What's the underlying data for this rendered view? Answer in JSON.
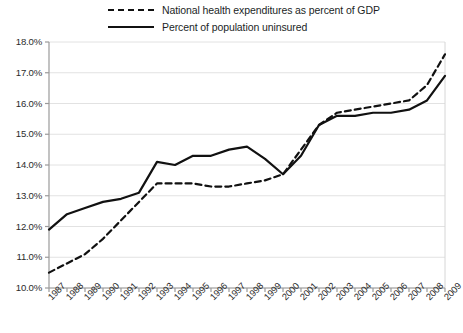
{
  "chart_data": {
    "type": "line",
    "title": "",
    "xlabel": "",
    "ylabel": "",
    "ylim": [
      10.0,
      18.0
    ],
    "ytick_values": [
      18.0,
      17.0,
      16.0,
      15.0,
      14.0,
      13.0,
      12.0,
      11.0,
      10.0
    ],
    "ytick_labels": [
      "18.0%",
      "17.0%",
      "16.0%",
      "15.0%",
      "14.0%",
      "13.0%",
      "12.0%",
      "11.0%",
      "10.0%"
    ],
    "grid": true,
    "legend_position": "top",
    "categories": [
      "1987",
      "1988",
      "1989",
      "1990",
      "1991",
      "1992",
      "1993",
      "1994",
      "1995",
      "1996",
      "1997",
      "1998",
      "1999",
      "2000",
      "2001",
      "2002",
      "2003",
      "2004",
      "2005",
      "2006",
      "2007",
      "2008",
      "2009"
    ],
    "series": [
      {
        "name": "National health expenditures as percent of GDP",
        "style": "dashed",
        "color": "#111111",
        "values": [
          10.5,
          10.8,
          11.1,
          11.6,
          12.2,
          12.8,
          13.4,
          13.4,
          13.4,
          13.3,
          13.3,
          13.4,
          13.5,
          13.7,
          14.5,
          15.3,
          15.7,
          15.8,
          15.9,
          16.0,
          16.1,
          16.6,
          17.6
        ]
      },
      {
        "name": "Percent of population uninsured",
        "style": "solid",
        "color": "#111111",
        "values": [
          11.9,
          12.4,
          12.6,
          12.8,
          12.9,
          13.1,
          14.1,
          14.0,
          14.3,
          14.3,
          14.5,
          14.6,
          14.2,
          13.7,
          14.3,
          15.3,
          15.6,
          15.6,
          15.7,
          15.7,
          15.8,
          16.1,
          16.9
        ]
      }
    ]
  }
}
